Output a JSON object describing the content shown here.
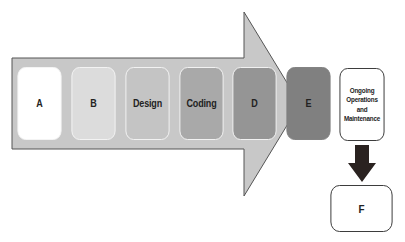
{
  "diagram": {
    "type": "process-flow",
    "main_arrow": {
      "fill": "#c8c8c8",
      "stroke": "#555555",
      "direction": "right"
    },
    "phases": [
      {
        "label": "A",
        "fill": "#ffffff"
      },
      {
        "label": "B",
        "fill": "#dcdcdc"
      },
      {
        "label": "Design",
        "fill": "#c4c4c4"
      },
      {
        "label": "Coding",
        "fill": "#a9a9a9"
      },
      {
        "label": "D",
        "fill": "#959595"
      },
      {
        "label": "E",
        "fill": "#808080"
      }
    ],
    "ongoing_box": {
      "lines": [
        "Ongoing",
        "Operations",
        "and",
        "Maintenance"
      ]
    },
    "down_arrow": {
      "fill": "#2a2220",
      "direction": "down"
    },
    "final_box": {
      "label": "F"
    }
  }
}
